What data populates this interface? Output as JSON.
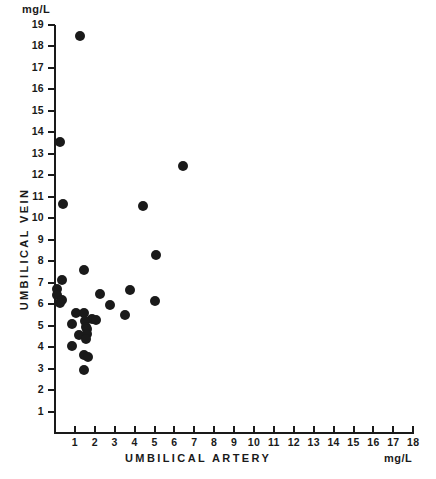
{
  "chart_data": {
    "type": "scatter",
    "title": "",
    "xlabel": "UMBILICAL ARTERY",
    "ylabel": "UMBILICAL VEIN",
    "x_unit": "mg/L",
    "y_unit": "mg/L",
    "xlim": [
      0,
      18
    ],
    "ylim": [
      0,
      19
    ],
    "grid": false,
    "legend": null,
    "xticks": [
      1,
      2,
      3,
      4,
      5,
      6,
      7,
      8,
      9,
      10,
      11,
      12,
      13,
      14,
      15,
      16,
      17,
      18
    ],
    "yticks": [
      1,
      2,
      3,
      4,
      5,
      6,
      7,
      8,
      9,
      10,
      11,
      12,
      13,
      14,
      15,
      16,
      17,
      18,
      19
    ],
    "xtick_labels": [
      "1",
      "2",
      "3",
      "4",
      "5",
      "6",
      "7",
      "8",
      "9",
      "10",
      "11",
      "12",
      "13",
      "14",
      "15",
      "16",
      "17",
      "18"
    ],
    "ytick_labels": [
      "1",
      "2",
      "3",
      "4",
      "5",
      "6",
      "7",
      "8",
      "9",
      "10",
      "11",
      "12",
      "13",
      "14",
      "15",
      "16",
      "17",
      "18",
      "19"
    ],
    "marker": "filled-circle",
    "marker_color": "#1a1a1a",
    "marker_size_px": 10,
    "points": [
      {
        "x": 1.25,
        "y": 18.45
      },
      {
        "x": 0.25,
        "y": 13.55
      },
      {
        "x": 6.45,
        "y": 12.4
      },
      {
        "x": 0.4,
        "y": 10.65
      },
      {
        "x": 4.4,
        "y": 10.55
      },
      {
        "x": 5.1,
        "y": 8.3
      },
      {
        "x": 1.45,
        "y": 7.6
      },
      {
        "x": 0.35,
        "y": 7.1
      },
      {
        "x": 0.1,
        "y": 6.7
      },
      {
        "x": 0.1,
        "y": 6.4
      },
      {
        "x": 3.75,
        "y": 6.65
      },
      {
        "x": 2.25,
        "y": 6.45
      },
      {
        "x": 0.35,
        "y": 6.2
      },
      {
        "x": 0.25,
        "y": 6.05
      },
      {
        "x": 5.0,
        "y": 6.15
      },
      {
        "x": 2.75,
        "y": 5.95
      },
      {
        "x": 1.05,
        "y": 5.6
      },
      {
        "x": 1.45,
        "y": 5.6
      },
      {
        "x": 3.5,
        "y": 5.5
      },
      {
        "x": 1.85,
        "y": 5.3
      },
      {
        "x": 2.05,
        "y": 5.25
      },
      {
        "x": 1.5,
        "y": 5.2
      },
      {
        "x": 0.85,
        "y": 5.05
      },
      {
        "x": 1.55,
        "y": 4.95
      },
      {
        "x": 1.6,
        "y": 4.85
      },
      {
        "x": 1.2,
        "y": 4.55
      },
      {
        "x": 1.6,
        "y": 4.6
      },
      {
        "x": 1.55,
        "y": 4.35
      },
      {
        "x": 0.85,
        "y": 4.05
      },
      {
        "x": 1.45,
        "y": 3.65
      },
      {
        "x": 1.65,
        "y": 3.55
      },
      {
        "x": 1.45,
        "y": 2.95
      }
    ]
  },
  "axes": {
    "unit_top_left": "mg/L",
    "unit_bottom_right": "mg/L"
  }
}
